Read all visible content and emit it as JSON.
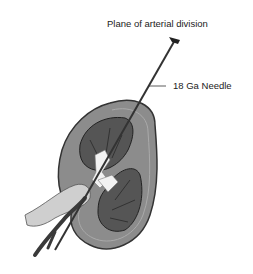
{
  "diagram": {
    "labels": {
      "plane": "Plane of arterial division",
      "needle": "18 Ga Needle"
    },
    "colors": {
      "capsule": "#8a8a8a",
      "capsule_edge": "#3a3a3a",
      "lobe": "#5a5a5a",
      "needle": "#333333",
      "vessel": "#444444",
      "hilum": "#f2f2f2",
      "ureter": "#c8c8c8"
    }
  }
}
